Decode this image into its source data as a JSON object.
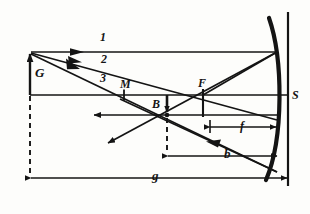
{
  "figure": {
    "kind": "optics-ray-diagram",
    "ink_color": "#141414",
    "background_color": "#fdfdfb"
  },
  "labels": {
    "ray1": "1",
    "ray2": "2",
    "ray3": "3",
    "object_height": "G",
    "mirror_vertex_point": "M",
    "focal_point": "F",
    "image_point": "B",
    "mirror": "S",
    "focal_length": "f",
    "image_distance": "b",
    "object_distance": "g"
  },
  "geometry": {
    "axis_y": 95,
    "object_x": 30,
    "object_tip_y": 52,
    "vertex_m_x": 124,
    "focus_x": 203,
    "image_x": 167,
    "image_y": 115,
    "mirror_vertex_x": 277,
    "screen_x": 288,
    "dim_line_b_y": 156,
    "dim_line_g_y": 178,
    "dim_line_f_y": 127
  }
}
